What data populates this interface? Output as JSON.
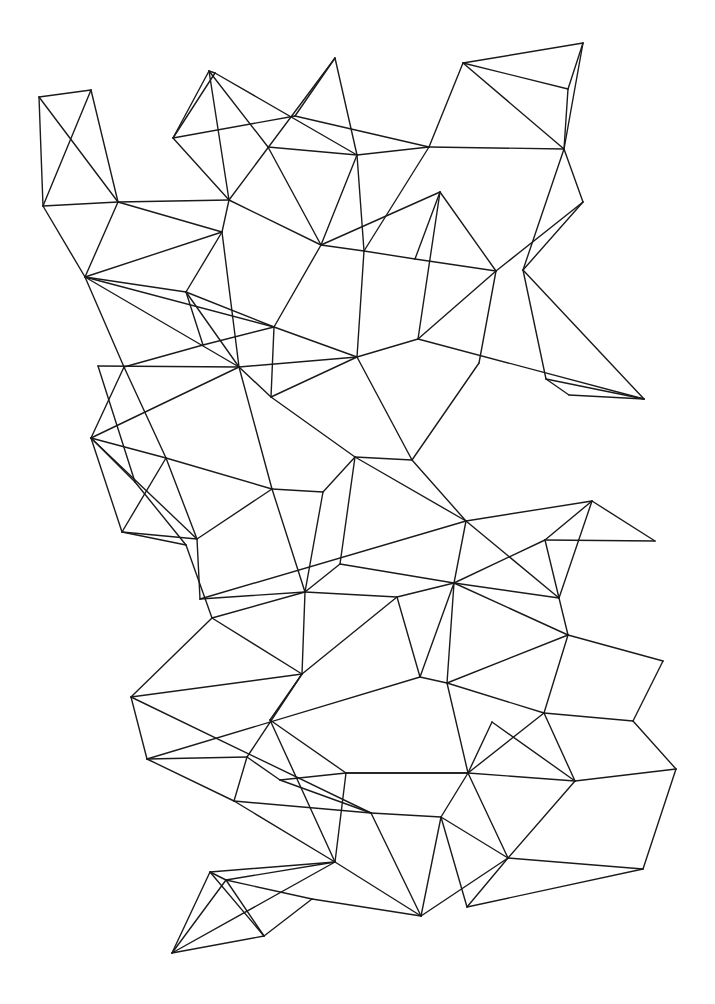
{
  "diagram": {
    "type": "wireframe-mesh",
    "background": "#ffffff",
    "stroke": "#1a1a1a",
    "vertices": {
      "A": [
        39,
        97
      ],
      "B": [
        91,
        90
      ],
      "C": [
        43,
        206
      ],
      "D": [
        118,
        202
      ],
      "E": [
        229,
        200
      ],
      "F": [
        85,
        277
      ],
      "G": [
        209,
        71
      ],
      "G2": [
        215,
        73
      ],
      "H": [
        173,
        138
      ],
      "I": [
        335,
        58
      ],
      "J": [
        295,
        116
      ],
      "K": [
        268,
        147
      ],
      "L": [
        357,
        155
      ],
      "M": [
        321,
        245
      ],
      "N": [
        222,
        232
      ],
      "P": [
        463,
        63
      ],
      "Q": [
        583,
        43
      ],
      "R": [
        568,
        89
      ],
      "S": [
        564,
        149
      ],
      "T": [
        429,
        147
      ],
      "U": [
        440,
        192
      ],
      "V": [
        583,
        202
      ],
      "W": [
        364,
        251
      ],
      "X": [
        415,
        259
      ],
      "Y": [
        496,
        271
      ],
      "Z": [
        523,
        270
      ],
      "AA": [
        186,
        292
      ],
      "AB": [
        203,
        345
      ],
      "AC": [
        274,
        327
      ],
      "AD": [
        124,
        367
      ],
      "AD0": [
        98,
        366
      ],
      "AE": [
        239,
        367
      ],
      "AF": [
        271,
        397
      ],
      "AG": [
        357,
        357
      ],
      "AH": [
        383,
        356
      ],
      "AI": [
        91,
        438
      ],
      "AJ": [
        166,
        458
      ],
      "BA": [
        418,
        339
      ],
      "BC": [
        479,
        363
      ],
      "BD": [
        546,
        379
      ],
      "BE": [
        569,
        395
      ],
      "BF": [
        644,
        399
      ],
      "BG": [
        412,
        460
      ],
      "BH": [
        135,
        482
      ],
      "BI": [
        122,
        532
      ],
      "BJ": [
        186,
        545
      ],
      "BK": [
        197,
        539
      ],
      "BL": [
        272,
        489
      ],
      "BM": [
        323,
        492
      ],
      "BN": [
        355,
        457
      ],
      "BP": [
        305,
        592
      ],
      "BQ": [
        200,
        599
      ],
      "BR": [
        212,
        618
      ],
      "BS": [
        397,
        597
      ],
      "BT": [
        340,
        564
      ],
      "CA": [
        466,
        521
      ],
      "CB": [
        592,
        501
      ],
      "CC": [
        545,
        540
      ],
      "CD": [
        655,
        541
      ],
      "CE": [
        454,
        583
      ],
      "CF": [
        559,
        598
      ],
      "CG": [
        568,
        635
      ],
      "CH": [
        663,
        661
      ],
      "CI": [
        420,
        677
      ],
      "CJ": [
        447,
        683
      ],
      "BU": [
        131,
        697
      ],
      "BV": [
        302,
        674
      ],
      "BW": [
        147,
        759
      ],
      "BX": [
        270,
        720
      ],
      "BY": [
        247,
        757
      ],
      "BZ": [
        280,
        780
      ],
      "CK": [
        346,
        773
      ],
      "CL": [
        234,
        801
      ],
      "CM": [
        371,
        813
      ],
      "CN": [
        544,
        713
      ],
      "CO": [
        633,
        721
      ],
      "CP": [
        492,
        722
      ],
      "CQ": [
        468,
        773
      ],
      "CR": [
        575,
        781
      ],
      "CS": [
        676,
        769
      ],
      "CT": [
        441,
        817
      ],
      "CU": [
        508,
        858
      ],
      "CV": [
        643,
        869
      ],
      "CW": [
        467,
        907
      ],
      "DG": [
        421,
        916
      ],
      "DA": [
        335,
        862
      ],
      "DB": [
        210,
        872
      ],
      "DC": [
        226,
        880
      ],
      "DD": [
        312,
        899
      ],
      "DE": [
        264,
        936
      ],
      "DF": [
        172,
        953
      ]
    },
    "edges": [
      [
        "A",
        "B"
      ],
      [
        "A",
        "C"
      ],
      [
        "A",
        "D"
      ],
      [
        "B",
        "C"
      ],
      [
        "B",
        "D"
      ],
      [
        "C",
        "D"
      ],
      [
        "D",
        "E"
      ],
      [
        "C",
        "F"
      ],
      [
        "D",
        "F"
      ],
      [
        "D",
        "N"
      ],
      [
        "F",
        "N"
      ],
      [
        "G",
        "G2"
      ],
      [
        "G2",
        "H"
      ],
      [
        "G",
        "H"
      ],
      [
        "G",
        "E"
      ],
      [
        "G",
        "K"
      ],
      [
        "G2",
        "L"
      ],
      [
        "H",
        "E"
      ],
      [
        "H",
        "J"
      ],
      [
        "I",
        "E"
      ],
      [
        "I",
        "L"
      ],
      [
        "I",
        "J"
      ],
      [
        "J",
        "T"
      ],
      [
        "K",
        "L"
      ],
      [
        "K",
        "M"
      ],
      [
        "E",
        "M"
      ],
      [
        "E",
        "N"
      ],
      [
        "L",
        "T"
      ],
      [
        "L",
        "M"
      ],
      [
        "L",
        "W"
      ],
      [
        "T",
        "W"
      ],
      [
        "T",
        "P"
      ],
      [
        "T",
        "S"
      ],
      [
        "P",
        "Q"
      ],
      [
        "P",
        "R"
      ],
      [
        "P",
        "S"
      ],
      [
        "Q",
        "R"
      ],
      [
        "Q",
        "S"
      ],
      [
        "R",
        "S"
      ],
      [
        "S",
        "V"
      ],
      [
        "S",
        "Z"
      ],
      [
        "V",
        "Y"
      ],
      [
        "V",
        "Z"
      ],
      [
        "U",
        "M"
      ],
      [
        "U",
        "X"
      ],
      [
        "U",
        "Y"
      ],
      [
        "M",
        "W"
      ],
      [
        "M",
        "AC"
      ],
      [
        "W",
        "X"
      ],
      [
        "X",
        "Y"
      ],
      [
        "W",
        "AG"
      ],
      [
        "X",
        "BB"
      ],
      [
        "U",
        "BA"
      ],
      [
        "Y",
        "BA"
      ],
      [
        "Y",
        "BC"
      ],
      [
        "Z",
        "BD"
      ],
      [
        "Z",
        "BF"
      ],
      [
        "BA",
        "BB"
      ],
      [
        "BA",
        "BF"
      ],
      [
        "BB",
        "BE"
      ],
      [
        "BB",
        "AG"
      ],
      [
        "BC",
        "BG"
      ],
      [
        "BD",
        "BE"
      ],
      [
        "BD",
        "BF"
      ],
      [
        "BE",
        "BF"
      ],
      [
        "BB",
        "BG"
      ],
      [
        "AG",
        "BA"
      ],
      [
        "F",
        "AA"
      ],
      [
        "F",
        "AD"
      ],
      [
        "F",
        "AE"
      ],
      [
        "F",
        "AC"
      ],
      [
        "N",
        "AA"
      ],
      [
        "N",
        "AE"
      ],
      [
        "AA",
        "AB"
      ],
      [
        "AA",
        "AE"
      ],
      [
        "AA",
        "AC"
      ],
      [
        "AB",
        "AD"
      ],
      [
        "AB",
        "AC"
      ],
      [
        "AC",
        "AF"
      ],
      [
        "AC",
        "AG"
      ],
      [
        "AE",
        "AF"
      ],
      [
        "AE",
        "AG"
      ],
      [
        "AD0",
        "AE"
      ],
      [
        "AD",
        "AI"
      ],
      [
        "AD0",
        "BH"
      ],
      [
        "AD",
        "AJ"
      ],
      [
        "AE",
        "AI"
      ],
      [
        "AE",
        "BL"
      ],
      [
        "AF",
        "AG"
      ],
      [
        "AF",
        "AK"
      ],
      [
        "AG",
        "AK"
      ],
      [
        "AG",
        "BG"
      ],
      [
        "AF",
        "BN"
      ],
      [
        "AI",
        "AJ"
      ],
      [
        "AI",
        "BI"
      ],
      [
        "AI",
        "BK"
      ],
      [
        "AI",
        "BH"
      ],
      [
        "AJ",
        "BI"
      ],
      [
        "AJ",
        "BL"
      ],
      [
        "BH",
        "BJ"
      ],
      [
        "BI",
        "BJ"
      ],
      [
        "BI",
        "BK"
      ],
      [
        "AJ",
        "BK"
      ],
      [
        "BK",
        "BL"
      ],
      [
        "BL",
        "BM"
      ],
      [
        "BM",
        "BN"
      ],
      [
        "BN",
        "BG"
      ],
      [
        "BL",
        "BP"
      ],
      [
        "BM",
        "BP"
      ],
      [
        "BN",
        "BT"
      ],
      [
        "BG",
        "CA"
      ],
      [
        "BN",
        "CA"
      ],
      [
        "BK",
        "BQ"
      ],
      [
        "BJ",
        "BR"
      ],
      [
        "BQ",
        "BP"
      ],
      [
        "BQ",
        "CA"
      ],
      [
        "BR",
        "BP"
      ],
      [
        "BR",
        "BV"
      ],
      [
        "BR",
        "BU"
      ],
      [
        "BT",
        "BP"
      ],
      [
        "BT",
        "CE"
      ],
      [
        "BP",
        "BS"
      ],
      [
        "BP",
        "BV"
      ],
      [
        "BS",
        "CE"
      ],
      [
        "BS",
        "CI"
      ],
      [
        "BS",
        "BV"
      ],
      [
        "CA",
        "CB"
      ],
      [
        "CA",
        "CF"
      ],
      [
        "CA",
        "CE"
      ],
      [
        "CB",
        "CC"
      ],
      [
        "CB",
        "CD"
      ],
      [
        "CB",
        "CF"
      ],
      [
        "CC",
        "CD"
      ],
      [
        "CC",
        "CE"
      ],
      [
        "CC",
        "CF"
      ],
      [
        "CE",
        "CF"
      ],
      [
        "CE",
        "CI"
      ],
      [
        "CE",
        "CJ"
      ],
      [
        "CF",
        "CG"
      ],
      [
        "CE",
        "CG"
      ],
      [
        "CG",
        "CH"
      ],
      [
        "CG",
        "CJ"
      ],
      [
        "CG",
        "CN"
      ],
      [
        "CH",
        "CO"
      ],
      [
        "BU",
        "BV"
      ],
      [
        "BU",
        "BW"
      ],
      [
        "BU",
        "CM"
      ],
      [
        "BV",
        "BY"
      ],
      [
        "BV",
        "BX"
      ],
      [
        "BW",
        "CI"
      ],
      [
        "BW",
        "BY"
      ],
      [
        "BW",
        "CL"
      ],
      [
        "BX",
        "CK"
      ],
      [
        "BX",
        "DA"
      ],
      [
        "BY",
        "BZ"
      ],
      [
        "BY",
        "CL"
      ],
      [
        "BZ",
        "CK"
      ],
      [
        "BZ",
        "CM"
      ],
      [
        "CK",
        "CQ"
      ],
      [
        "CK",
        "DA"
      ],
      [
        "CL",
        "DA"
      ],
      [
        "CL",
        "CM"
      ],
      [
        "CM",
        "CT"
      ],
      [
        "CM",
        "DG"
      ],
      [
        "CI",
        "CJ"
      ],
      [
        "CJ",
        "CN"
      ],
      [
        "CJ",
        "CQ"
      ],
      [
        "CN",
        "CO"
      ],
      [
        "CN",
        "CQ"
      ],
      [
        "CN",
        "CR"
      ],
      [
        "CO",
        "CS"
      ],
      [
        "CP",
        "CQ"
      ],
      [
        "CP",
        "CR"
      ],
      [
        "CQ",
        "CR"
      ],
      [
        "CQ",
        "CT"
      ],
      [
        "CQ",
        "CU"
      ],
      [
        "CR",
        "CS"
      ],
      [
        "CR",
        "CU"
      ],
      [
        "CS",
        "CV"
      ],
      [
        "CU",
        "CV"
      ],
      [
        "CT",
        "CU"
      ],
      [
        "CT",
        "CW"
      ],
      [
        "CT",
        "DG"
      ],
      [
        "CU",
        "CW"
      ],
      [
        "CU",
        "DG"
      ],
      [
        "CV",
        "CW"
      ],
      [
        "CQ",
        "CK"
      ],
      [
        "DA",
        "DB"
      ],
      [
        "DA",
        "DC"
      ],
      [
        "DA",
        "DF"
      ],
      [
        "DB",
        "DC"
      ],
      [
        "DB",
        "DF"
      ],
      [
        "DB",
        "DE"
      ],
      [
        "DC",
        "DF"
      ],
      [
        "DC",
        "DD"
      ],
      [
        "DC",
        "DE"
      ],
      [
        "DD",
        "DG"
      ],
      [
        "DE",
        "DF"
      ],
      [
        "DE",
        "DD"
      ],
      [
        "DA",
        "DG"
      ]
    ]
  }
}
